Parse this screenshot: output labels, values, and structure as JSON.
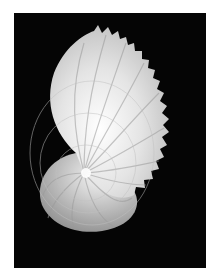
{
  "image": {
    "subject": "paper nautilus (argonaut) shell",
    "background_color": "#050505",
    "border_color": "#ffffff",
    "shell_color": "#e8e8e8"
  }
}
